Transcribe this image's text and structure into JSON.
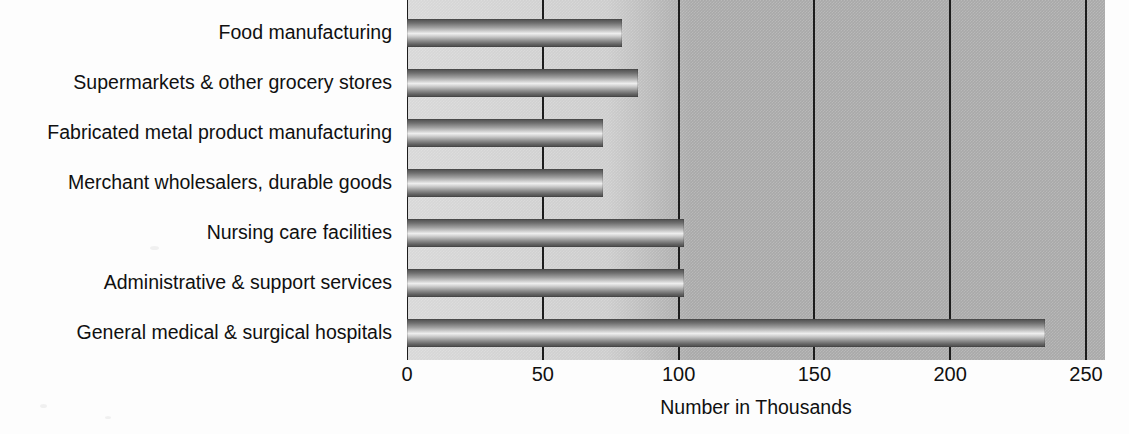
{
  "chart_data": {
    "type": "bar",
    "orientation": "horizontal",
    "title": "",
    "xlabel": "Number in Thousands",
    "ylabel": "",
    "xlim": [
      0,
      257
    ],
    "xticks": [
      0,
      50,
      100,
      150,
      200,
      250
    ],
    "xtick_labels": [
      "0",
      "50",
      "100",
      "150",
      "200",
      "250"
    ],
    "grid": true,
    "grid_axis": "x",
    "legend": null,
    "categories": [
      "Food manufacturing",
      "Supermarkets & other grocery stores",
      "Fabricated metal product manufacturing",
      "Merchant wholesalers, durable goods",
      "Nursing care facilities",
      "Administrative & support services",
      "General medical & surgical hospitals"
    ],
    "values": [
      79,
      85,
      72,
      72,
      102,
      102,
      235
    ],
    "colors": {
      "plot_background": "#a9a9a9",
      "page_background": "#fdfdfd",
      "gridline": "#1c1c1c",
      "text": "#101010",
      "bar_gradient_dark": "#4a4a4a",
      "bar_gradient_light": "#eeeeee"
    }
  }
}
